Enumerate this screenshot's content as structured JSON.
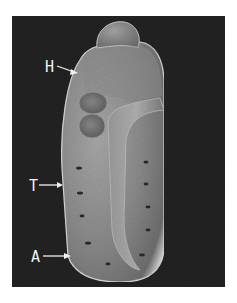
{
  "figure": {
    "type": "scanning-electron-micrograph",
    "background_color": "#1d1d1d",
    "specimen_color": "#8c8c8c",
    "labels": [
      {
        "id": "H",
        "text": "H"
      },
      {
        "id": "T",
        "text": "T"
      },
      {
        "id": "A",
        "text": "A"
      }
    ]
  }
}
